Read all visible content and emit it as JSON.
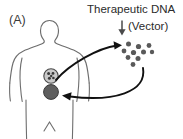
{
  "figure": {
    "panel_label": "(A)",
    "caption_line1": "Therapeutic DNA",
    "caption_line2": "(Vector)",
    "background_color": "#ffffff"
  },
  "colors": {
    "outline_gray": "#6e6e6e",
    "arrow_black": "#111111",
    "dot_gray": "#5a5a5a",
    "target_cell_fill": "#c9c9c9",
    "modified_cell_fill": "#5e5e5e",
    "text_gray": "#2b2b2b",
    "vector_arrow_gray": "#4a4a4a"
  },
  "body_figure": {
    "name": "human-torso-silhouette",
    "description": "outlined upper body with head, shoulders, arms, torso and upper legs"
  },
  "cells": [
    {
      "name": "target-cell",
      "label": "",
      "fill": "#c9c9c9",
      "stroke": "#4a4a4a",
      "cx": 51,
      "cy": 76,
      "r": 7.2,
      "nuclei": [
        {
          "cx": 48.6,
          "cy": 73.6,
          "r": 1.5
        },
        {
          "cx": 53.0,
          "cy": 73.4,
          "r": 1.4
        },
        {
          "cx": 49.4,
          "cy": 78.2,
          "r": 1.5
        },
        {
          "cx": 53.4,
          "cy": 78.0,
          "r": 1.3
        },
        {
          "cx": 51.2,
          "cy": 76.0,
          "r": 1.2
        }
      ]
    },
    {
      "name": "modified-cell",
      "label": "",
      "fill": "#5e5e5e",
      "stroke": "#3a3a3a",
      "cx": 51,
      "cy": 92,
      "r": 7.4,
      "nuclei": []
    }
  ],
  "vector_particles": {
    "name": "therapeutic-dna-vector-cluster",
    "count": 10,
    "fill": "#5a5a5a",
    "dots": [
      {
        "cx": 128.5,
        "cy": 44.0,
        "r": 2.5
      },
      {
        "cx": 138.5,
        "cy": 46.5,
        "r": 2.6
      },
      {
        "cx": 149.0,
        "cy": 45.5,
        "r": 2.4
      },
      {
        "cx": 124.0,
        "cy": 51.0,
        "r": 2.4
      },
      {
        "cx": 133.5,
        "cy": 52.5,
        "r": 2.6
      },
      {
        "cx": 143.5,
        "cy": 52.0,
        "r": 2.5
      },
      {
        "cx": 128.0,
        "cy": 57.5,
        "r": 2.4
      },
      {
        "cx": 138.0,
        "cy": 58.5,
        "r": 2.5
      },
      {
        "cx": 133.0,
        "cy": 64.5,
        "r": 2.4
      },
      {
        "cx": 152.0,
        "cy": 52.0,
        "r": 2.2
      }
    ]
  },
  "arrows": [
    {
      "name": "arrow-cell-to-vector",
      "direction": "cell to vector cluster",
      "path": "M 56 80 C 70 64, 98 48, 120 46"
    },
    {
      "name": "arrow-vector-to-cell",
      "direction": "vector cluster back to modified cell",
      "path": "M 140 70 C 142 92, 110 102, 66 97"
    },
    {
      "name": "vector-label-arrow",
      "direction": "downward from caption to cluster",
      "path": "M 122 21 L 122 33"
    }
  ]
}
